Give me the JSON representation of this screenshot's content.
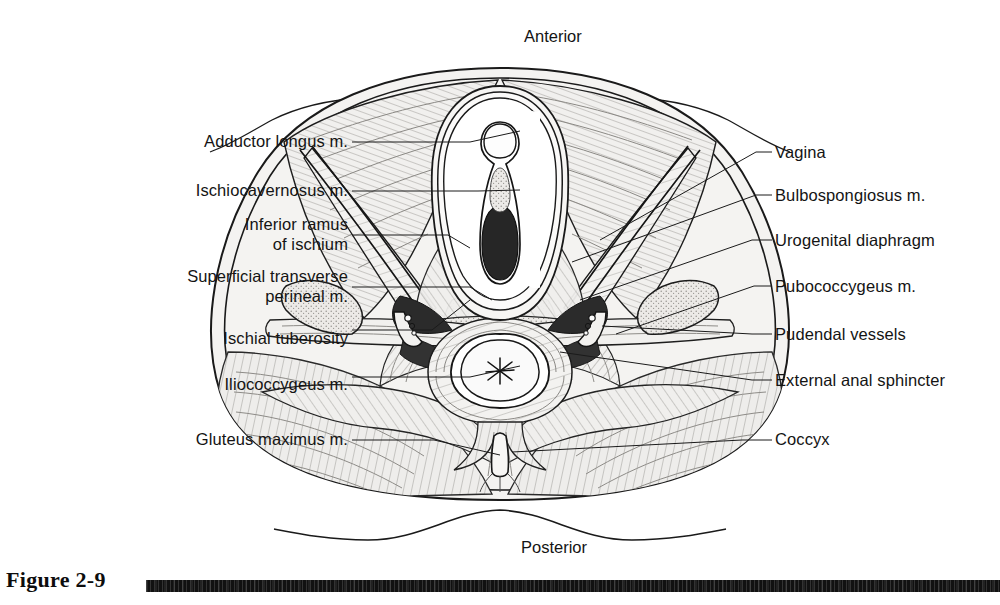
{
  "figure": {
    "caption": "Figure 2-9",
    "orientation": {
      "anterior": "Anterior",
      "posterior": "Posterior"
    }
  },
  "labels": {
    "left": [
      {
        "name": "adductor-longus",
        "lines": [
          "Adductor longus m."
        ],
        "x": 348,
        "y": 131,
        "leader_x1": 352,
        "leader_x2": 470,
        "leader_y": 142
      },
      {
        "name": "ischiocavernosus",
        "lines": [
          "Ischiocavernosus m."
        ],
        "x": 348,
        "y": 180,
        "leader_x1": 352,
        "leader_x2": 478,
        "leader_y": 191
      },
      {
        "name": "inferior-ramus-of-ischium",
        "lines": [
          "Inferior ramus",
          "of ischium"
        ],
        "x": 348,
        "y": 214,
        "leader_x1": 352,
        "leader_x2": 448,
        "leader_y": 235
      },
      {
        "name": "superficial-transverse-perineal",
        "lines": [
          "Superficial transverse",
          "perineal m."
        ],
        "x": 348,
        "y": 266,
        "leader_x1": 352,
        "leader_x2": 470,
        "leader_y": 287
      },
      {
        "name": "ischial-tuberosity",
        "lines": [
          "Ischial tuberosity"
        ],
        "x": 348,
        "y": 328,
        "leader_x1": 352,
        "leader_x2": 432,
        "leader_y": 330
      },
      {
        "name": "iliococcygeus",
        "lines": [
          "Iliococcygeus m."
        ],
        "x": 348,
        "y": 374,
        "leader_x1": 352,
        "leader_x2": 470,
        "leader_y": 377
      },
      {
        "name": "gluteus-maximus",
        "lines": [
          "Gluteus maximus m."
        ],
        "x": 348,
        "y": 429,
        "leader_x1": 352,
        "leader_x2": 434,
        "leader_y": 440
      }
    ],
    "right": [
      {
        "name": "vagina",
        "lines": [
          "Vagina"
        ],
        "x": 775,
        "y": 142,
        "leader_x1": 756,
        "leader_x2": 772,
        "leader_y": 152
      },
      {
        "name": "bulbospongiosus",
        "lines": [
          "Bulbospongiosus m."
        ],
        "x": 775,
        "y": 185,
        "leader_x1": 756,
        "leader_x2": 772,
        "leader_y": 195
      },
      {
        "name": "urogenital-diaphragm",
        "lines": [
          "Urogenital diaphragm"
        ],
        "x": 775,
        "y": 230,
        "leader_x1": 752,
        "leader_x2": 772,
        "leader_y": 240
      },
      {
        "name": "pubococcygeus",
        "lines": [
          "Pubococcygeus m."
        ],
        "x": 775,
        "y": 276,
        "leader_x1": 754,
        "leader_x2": 772,
        "leader_y": 286
      },
      {
        "name": "pudendal-vessels",
        "lines": [
          "Pudendal vessels"
        ],
        "x": 775,
        "y": 324,
        "leader_x1": 752,
        "leader_x2": 772,
        "leader_y": 334
      },
      {
        "name": "external-anal-sphincter",
        "lines": [
          "External anal sphincter"
        ],
        "x": 775,
        "y": 370,
        "leader_x1": 752,
        "leader_x2": 772,
        "leader_y": 380
      },
      {
        "name": "coccyx",
        "lines": [
          "Coccyx"
        ],
        "x": 775,
        "y": 429,
        "leader_x1": 742,
        "leader_x2": 772,
        "leader_y": 440
      }
    ]
  },
  "colors": {
    "ink": "#141414",
    "line": "#1a1a1a",
    "tissue_light": "#efeeec",
    "tissue_mid": "#e2e1de",
    "tissue_dark": "#cfcdc9",
    "cavity_dark": "#2a2a2a",
    "caption_bar": "#111111",
    "background": "#ffffff"
  }
}
